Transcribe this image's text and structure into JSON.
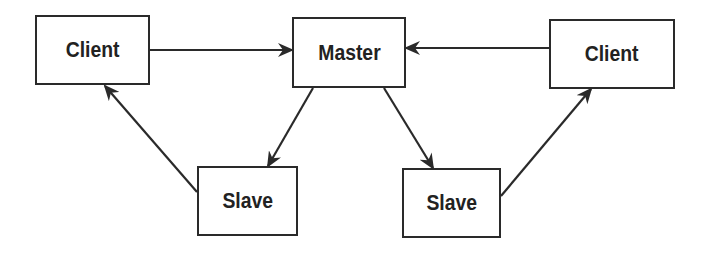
{
  "diagram": {
    "title": "",
    "colors": {
      "stroke": "#2a2a2a",
      "text": "#222222",
      "background": "#ffffff"
    },
    "nodes": [
      {
        "id": "client-left",
        "label": "Client",
        "x": 35,
        "y": 15,
        "w": 115,
        "h": 70
      },
      {
        "id": "master",
        "label": "Master",
        "x": 292,
        "y": 17,
        "w": 114,
        "h": 71
      },
      {
        "id": "client-right",
        "label": "Client",
        "x": 549,
        "y": 19,
        "w": 126,
        "h": 70
      },
      {
        "id": "slave-left",
        "label": "Slave",
        "x": 197,
        "y": 166,
        "w": 101,
        "h": 70
      },
      {
        "id": "slave-right",
        "label": "Slave",
        "x": 402,
        "y": 168,
        "w": 99,
        "h": 70
      }
    ],
    "edges": [
      {
        "from": "client-left",
        "to": "master",
        "x1": 150,
        "y1": 50,
        "x2": 292,
        "y2": 50
      },
      {
        "from": "client-right",
        "to": "master",
        "x1": 549,
        "y1": 48,
        "x2": 406,
        "y2": 48
      },
      {
        "from": "master",
        "to": "slave-left",
        "x1": 313,
        "y1": 88,
        "x2": 268,
        "y2": 166
      },
      {
        "from": "master",
        "to": "slave-right",
        "x1": 384,
        "y1": 88,
        "x2": 433,
        "y2": 168
      },
      {
        "from": "slave-left",
        "to": "client-left",
        "x1": 197,
        "y1": 192,
        "x2": 105,
        "y2": 86
      },
      {
        "from": "slave-right",
        "to": "client-right",
        "x1": 501,
        "y1": 196,
        "x2": 591,
        "y2": 89
      }
    ]
  }
}
